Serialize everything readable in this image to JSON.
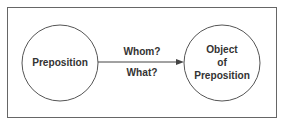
{
  "diagram": {
    "nodes": [
      {
        "id": "preposition",
        "label": "Preposition"
      },
      {
        "id": "object",
        "label_lines": [
          "Object",
          "of",
          "Preposition"
        ]
      }
    ],
    "edge": {
      "from": "preposition",
      "to": "object",
      "label_lines": [
        "Whom?",
        "What?"
      ]
    },
    "colors": {
      "stroke": "#444444",
      "text": "#333333",
      "background": "#ffffff"
    }
  }
}
